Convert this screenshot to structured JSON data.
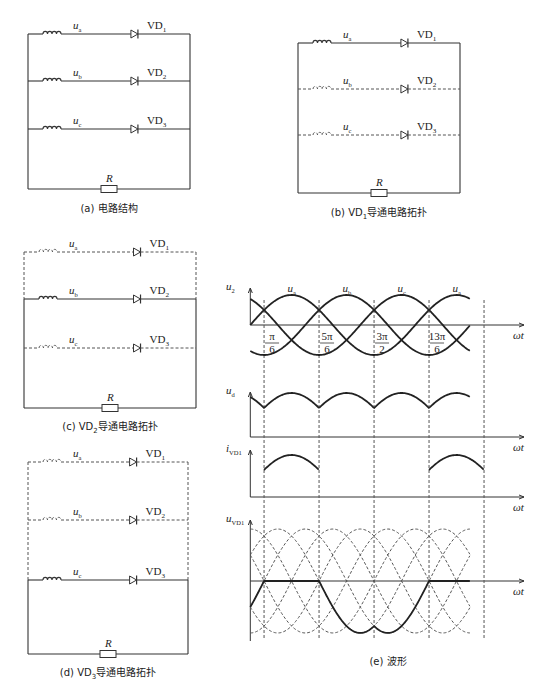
{
  "panels": {
    "a": {
      "caption": "(a) 电路结构",
      "branches": [
        {
          "voltage": "u",
          "voltage_sub": "a",
          "diode": "VD",
          "diode_sub": "1",
          "style": "solid"
        },
        {
          "voltage": "u",
          "voltage_sub": "b",
          "diode": "VD",
          "diode_sub": "2",
          "style": "solid"
        },
        {
          "voltage": "u",
          "voltage_sub": "c",
          "diode": "VD",
          "diode_sub": "3",
          "style": "solid"
        }
      ],
      "resistor": "R"
    },
    "b": {
      "caption_prefix": "(b) VD",
      "caption_sub": "1",
      "caption_suffix": "导通电路拓扑",
      "branches": [
        {
          "voltage": "u",
          "voltage_sub": "a",
          "diode": "VD",
          "diode_sub": "1",
          "style": "solid"
        },
        {
          "voltage": "u",
          "voltage_sub": "b",
          "diode": "VD",
          "diode_sub": "2",
          "style": "dashed"
        },
        {
          "voltage": "u",
          "voltage_sub": "c",
          "diode": "VD",
          "diode_sub": "3",
          "style": "dashed"
        }
      ],
      "resistor": "R"
    },
    "c": {
      "caption_prefix": "(c) VD",
      "caption_sub": "2",
      "caption_suffix": "导通电路拓扑",
      "branches": [
        {
          "voltage": "u",
          "voltage_sub": "a",
          "diode": "VD",
          "diode_sub": "1",
          "style": "dashed"
        },
        {
          "voltage": "u",
          "voltage_sub": "b",
          "diode": "VD",
          "diode_sub": "2",
          "style": "solid"
        },
        {
          "voltage": "u",
          "voltage_sub": "c",
          "diode": "VD",
          "diode_sub": "3",
          "style": "dashed"
        }
      ],
      "resistor": "R"
    },
    "d": {
      "caption_prefix": "(d) VD",
      "caption_sub": "3",
      "caption_suffix": "导通电路拓扑",
      "branches": [
        {
          "voltage": "u",
          "voltage_sub": "a",
          "diode": "VD",
          "diode_sub": "1",
          "style": "dashed"
        },
        {
          "voltage": "u",
          "voltage_sub": "b",
          "diode": "VD",
          "diode_sub": "2",
          "style": "dashed"
        },
        {
          "voltage": "u",
          "voltage_sub": "c",
          "diode": "VD",
          "diode_sub": "3",
          "style": "solid"
        }
      ],
      "resistor": "R"
    },
    "e": {
      "caption": "(e) 波形",
      "plots": [
        {
          "ylabel": "u",
          "ylabel_sub": "2",
          "curve_labels": [
            {
              "main": "u",
              "sub": "a"
            },
            {
              "main": "u",
              "sub": "b"
            },
            {
              "main": "u",
              "sub": "c"
            },
            {
              "main": "u",
              "sub": "a"
            }
          ]
        },
        {
          "ylabel": "u",
          "ylabel_sub": "d"
        },
        {
          "ylabel": "i",
          "ylabel_sub": "VD1"
        },
        {
          "ylabel": "u",
          "ylabel_sub": "VD1"
        }
      ],
      "xlabel": "ωt",
      "ticks": [
        {
          "num": "π",
          "den": "6"
        },
        {
          "num": "5π",
          "den": "6"
        },
        {
          "num": "3π",
          "den": "2"
        },
        {
          "num": "13π",
          "den": "6"
        }
      ]
    }
  },
  "chart_data": {
    "type": "line",
    "xlabel": "ωt",
    "x_ticks": [
      "π/6",
      "5π/6",
      "3π/2",
      "13π/6"
    ],
    "x_tick_values_rad": [
      0.5236,
      2.618,
      4.712,
      6.807
    ],
    "grid": "dashed vertical lines at commutation points",
    "subplots": [
      {
        "ylabel": "u2",
        "series": [
          {
            "name": "ua",
            "expr": "sin(ωt)"
          },
          {
            "name": "ub",
            "expr": "sin(ωt - 2π/3)"
          },
          {
            "name": "uc",
            "expr": "sin(ωt + 2π/3)"
          }
        ]
      },
      {
        "ylabel": "ud",
        "series": [
          {
            "name": "ud",
            "expr": "max(ua, ub, uc)"
          }
        ]
      },
      {
        "ylabel": "iVD1",
        "series": [
          {
            "name": "iVD1",
            "expr": "ua/R for π/6 ≤ ωt ≤ 5π/6 (and 13π/6..17π/6), else 0"
          }
        ]
      },
      {
        "ylabel": "uVD1",
        "series": [
          {
            "name": "uVD1",
            "expr": "0 when VD1 on; ua - ub when VD2 on; ua - uc when VD3 on"
          },
          {
            "name": "line voltages (dashed)",
            "expr": "±(ua-ub), ±(ub-uc), ±(uc-ua)"
          }
        ]
      }
    ],
    "x_range_rad": [
      0,
      8.4
    ]
  }
}
